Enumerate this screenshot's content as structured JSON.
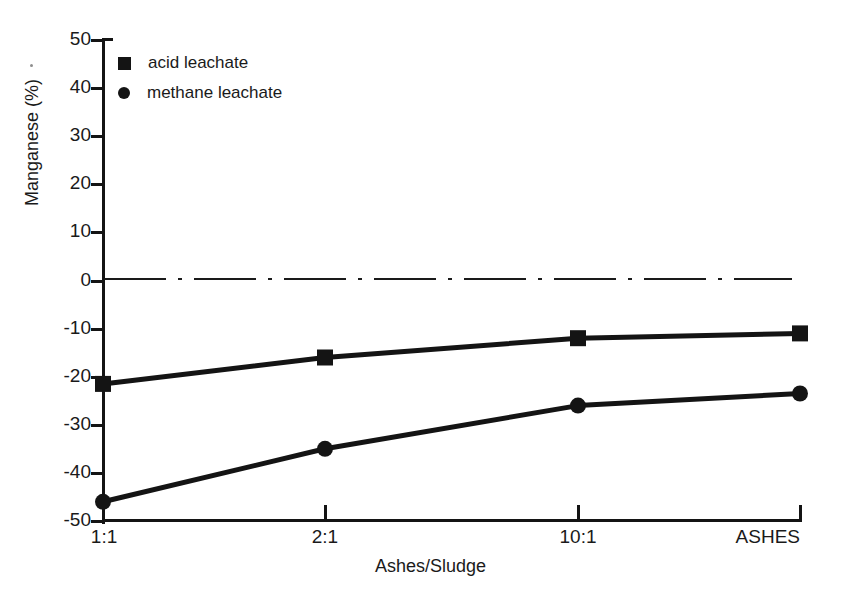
{
  "chart_data": {
    "type": "line",
    "title": "",
    "xlabel": "Ashes/Sludge",
    "ylabel": "Manganese (%)",
    "categories": [
      "1:1",
      "2:1",
      "10:1",
      "ASHES"
    ],
    "ylim": [
      -50,
      50
    ],
    "yticks": [
      50,
      40,
      30,
      20,
      10,
      0,
      -10,
      -20,
      -30,
      -40,
      -50
    ],
    "ytick_labels": [
      "50",
      "40",
      "30",
      "20",
      "10",
      "0",
      "-10",
      "-20",
      "-30",
      "-40",
      "-50"
    ],
    "grid": false,
    "legend_position": "top-left",
    "reference_line": {
      "value": 0,
      "style": "dash-dot",
      "label": ""
    },
    "series": [
      {
        "name": "acid leachate",
        "marker": "square",
        "values": [
          -21.5,
          -16,
          -12,
          -11
        ]
      },
      {
        "name": "methane leachate",
        "marker": "circle",
        "values": [
          -46,
          -35,
          -26,
          -23.5
        ]
      }
    ]
  },
  "legend": {
    "items": [
      {
        "label": "acid leachate",
        "marker": "square-marker-icon"
      },
      {
        "label": "methane leachate",
        "marker": "circle-marker-icon"
      }
    ]
  },
  "axes": {
    "y_title": "Manganese (%)",
    "x_title": "Ashes/Sludge"
  },
  "colors": {
    "ink": "#141414",
    "background": "#ffffff"
  }
}
